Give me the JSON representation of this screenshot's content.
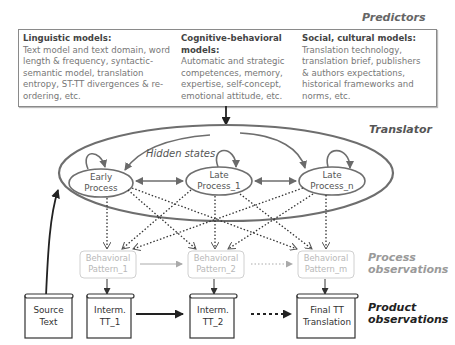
{
  "labels": {
    "predictors": "Predictors",
    "translator": "Translator",
    "hidden_states": "Hidden states",
    "process_observations_1": "Process",
    "process_observations_2": "observations",
    "product_observations_1": "Product",
    "product_observations_2": "observations"
  },
  "predictors": [
    {
      "heading": "Linguistic models:",
      "lines": [
        "Text model and text domain, word",
        "length & frequency, syntactic-",
        "semantic model, translation",
        "entropy, ST-TT divergences & re-",
        "ordering, etc."
      ]
    },
    {
      "heading_lines": [
        "Cognitive-behavioral",
        "models:"
      ],
      "lines": [
        "Automatic and strategic",
        "competences, memory,",
        "expertise, self-concept,",
        "emotional attitude, etc."
      ]
    },
    {
      "heading": "Social, cultural models:",
      "lines": [
        "Translation technology,",
        "translation brief, publishers",
        "& authors expectations,",
        "historical frameworks and",
        "norms, etc."
      ]
    }
  ],
  "hidden_state_nodes": [
    {
      "line1": "Early",
      "line2": "Process"
    },
    {
      "line1": "Late",
      "line2": "Process_1"
    },
    {
      "line1": "Late",
      "line2": "Process_n"
    }
  ],
  "behavioral_patterns": [
    {
      "line1": "Behavioral",
      "line2": "Pattern_1"
    },
    {
      "line1": "Behavioral",
      "line2": "Pattern_2"
    },
    {
      "line1": "Behavioral",
      "line2": "Pattern_m"
    }
  ],
  "documents": [
    {
      "line1": "Source",
      "line2": "Text"
    },
    {
      "line1": "Interm.",
      "line2": "TT_1"
    },
    {
      "line1": "Interm.",
      "line2": "TT_2"
    },
    {
      "line1": "Final TT",
      "line2": "Translation"
    }
  ],
  "colors": {
    "ellipse": "#6e6e6e",
    "pattern_border": "#d0d0d0",
    "pattern_text": "#b8b8b8",
    "process_label": "#9a9a9a",
    "product_label": "#222222"
  }
}
